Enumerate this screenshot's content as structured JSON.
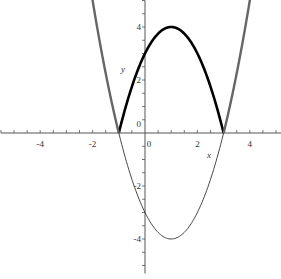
{
  "chart_data": {
    "type": "line",
    "title": "",
    "xlabel": "x",
    "ylabel": "y",
    "xlim": [
      -5.5,
      5.2
    ],
    "ylim": [
      -5.3,
      5.0
    ],
    "grid": false,
    "legend": null,
    "x_ticks": [
      -4,
      -2,
      0,
      2,
      4
    ],
    "x_tick_labels": [
      "-4",
      "-2",
      "0",
      "2",
      "4"
    ],
    "y_ticks": [
      -4,
      -2,
      0,
      2,
      4
    ],
    "y_tick_labels": [
      "-4",
      "-2",
      "0",
      "2",
      "4"
    ],
    "series": [
      {
        "name": "y = x^2 - 2x - 3",
        "style": "thin black",
        "x": [
          -1.6,
          -1,
          0,
          1,
          2,
          3,
          3.6
        ],
        "y": [
          2.76,
          0,
          -3,
          -4,
          -3,
          0,
          2.76
        ]
      },
      {
        "name": "y = |x^2 - 2x - 3| (between roots)",
        "style": "bold black",
        "x": [
          -1,
          0,
          1,
          2,
          3
        ],
        "y": [
          0,
          3,
          4,
          3,
          0
        ]
      },
      {
        "name": "y = |x^2 - 2x - 3| (outside roots)",
        "style": "thick gray",
        "x": [
          -2.05,
          -1.5,
          -1,
          3,
          3.5,
          4.05
        ],
        "y": [
          4.2,
          2.25,
          0,
          0,
          2.25,
          4.2
        ]
      }
    ],
    "annotations": []
  },
  "labels": {
    "x_axis": "x",
    "y_axis": "y"
  },
  "colors": {
    "axis": "#555555",
    "thin_curve": "#333333",
    "bold_curve": "#000000",
    "gray_curve": "#666666"
  }
}
